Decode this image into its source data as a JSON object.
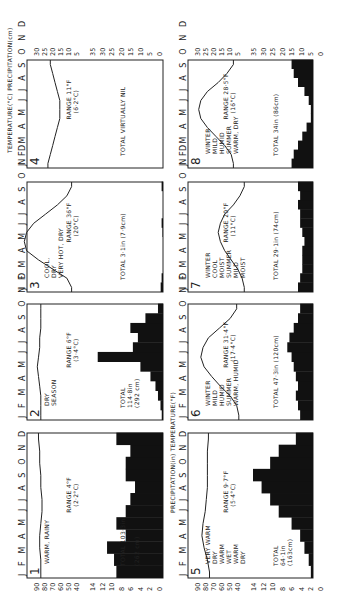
{
  "figure": {
    "orientation": "rotated-90-ccw",
    "left_axis_labels": {
      "top_row": "PRECIPITATION(in) TEMPERATURE(°F)",
      "bottom_row_temp": "°F",
      "bottom_row_precip": "in."
    },
    "right_axis_labels": {
      "top_row": "TEMPERATURE(°C) PRECIPITATION(cm)",
      "bottom_row_temp": "°C",
      "bottom_row_precip": "cm"
    },
    "months": "J F M A M J J A S O N D",
    "temp_f_ticks": [
      "90",
      "80",
      "70",
      "60",
      "50",
      "40"
    ],
    "precip_in_ticks": [
      "14",
      "12",
      "10",
      "8",
      "6",
      "4",
      "2",
      "0"
    ],
    "temp_c_ticks": [
      "30",
      "25",
      "20",
      "15",
      "10",
      "5"
    ],
    "precip_cm_ticks": [
      "35",
      "30",
      "25",
      "20",
      "15",
      "10",
      "5",
      "0"
    ]
  },
  "chart_data": [
    {
      "type": "bar+line",
      "panel": "1",
      "labels": [
        "WARM, RAINY"
      ],
      "range": "RANGE 4°F",
      "range_c": "(2·2°C)",
      "total": "TOTAL 103·3in",
      "total_cm": "(262 cm)",
      "icon": "tree",
      "temp_f": [
        80,
        80,
        81,
        81,
        80,
        79,
        79,
        80,
        80,
        81,
        81,
        82
      ],
      "precip_in": [
        10,
        10.5,
        12,
        8,
        10,
        8,
        7,
        6,
        8,
        8,
        7,
        10
      ]
    },
    {
      "type": "bar+line",
      "panel": "2",
      "labels": [
        "DRY",
        "SEASON"
      ],
      "range": "RANGE 6°F",
      "range_c": "(3·4°C)",
      "total": "TOTAL",
      "total_in": "114·8in",
      "total_cm": "(292 cm)",
      "icon": "H / tree",
      "temp_f": [
        80,
        80,
        80,
        81,
        82,
        83,
        82,
        81,
        81,
        80,
        80,
        80
      ],
      "precip_in": [
        0.5,
        1,
        2,
        3,
        5,
        9,
        26,
        12,
        10,
        13,
        7,
        2
      ]
    },
    {
      "type": "bar+line",
      "panel": "3",
      "labels": [
        "COOL,",
        "DRY",
        "VERY HOT, DRY"
      ],
      "range": "RANGE 36°F",
      "range_c": "(20°C)",
      "total": "TOTAL 3·1in (7·9cm)",
      "icon": "H",
      "temp_c": [
        12,
        14,
        20,
        26,
        31,
        32,
        31,
        28,
        23,
        18,
        14,
        12
      ],
      "precip_in": [
        0.5,
        0.3,
        0,
        0,
        0,
        0,
        0.1,
        0.3,
        0,
        0,
        0,
        0.3
      ]
    },
    {
      "type": "bar+line",
      "panel": "4",
      "labels": [],
      "range": "RANGE 11°F",
      "range_c": "(6·2°C)",
      "total": "TOTAL VIRTUALLY NIL",
      "icon": "H",
      "temp_c": [
        22,
        21,
        20,
        19,
        18,
        17,
        17,
        17,
        18,
        19,
        20,
        21
      ],
      "precip_in": [
        0,
        0,
        0,
        0,
        0,
        0,
        0,
        0,
        0,
        0,
        0,
        0
      ]
    },
    {
      "type": "bar+line",
      "panel": "5",
      "labels": [
        "VERY WARM",
        "DRY",
        "WARM",
        "WET",
        "WARM",
        "DRY"
      ],
      "range": "RANGE 9·7°F",
      "range_c": "(5·4°C)",
      "total": "TOTAL",
      "total_in": "64·1in",
      "total_cm": "(163cm)",
      "icon": "H / tree",
      "temp_f": [
        72,
        74,
        77,
        79,
        78,
        76,
        75,
        74,
        74,
        74,
        74,
        73
      ],
      "precip_in": [
        0.5,
        1,
        2,
        3,
        5,
        8,
        10,
        12,
        14,
        10,
        8,
        4
      ]
    },
    {
      "type": "bar+line",
      "panel": "6",
      "labels": [
        "WINTER",
        "MILD",
        "HUMID",
        "SUMMER",
        "WARM, HUMID"
      ],
      "range": "RANGE 31·4°F",
      "range_c": "(17·4°C)",
      "total": "TOTAL 47·3in (120cm)",
      "icon": "cyclone / H",
      "temp_f": [
        45,
        47,
        53,
        62,
        70,
        77,
        80,
        78,
        73,
        63,
        53,
        47
      ],
      "precip_in": [
        3,
        3.5,
        4,
        3.5,
        4,
        4.5,
        5,
        6,
        5.5,
        4.5,
        3.5,
        3
      ]
    },
    {
      "type": "bar+line",
      "panel": "7",
      "labels": [
        "WINTER",
        "COOL",
        "MOIST",
        "SUMMER",
        "MILD",
        "MOIST"
      ],
      "range": "RANGE 20°F",
      "range_c": "(11°C)",
      "total": "TOTAL 29·1in (74cm)",
      "icon": "cyclone",
      "temp_c": [
        5,
        6,
        8,
        11,
        14,
        16,
        17,
        16,
        14,
        10,
        7,
        5
      ],
      "precip_in": [
        3.5,
        3,
        2.5,
        2.5,
        2.5,
        2,
        2.5,
        3,
        3,
        3.5,
        3,
        3.5
      ]
    },
    {
      "type": "bar+line",
      "panel": "8",
      "labels": [
        "WINTER",
        "MILD",
        "HUMID",
        "SUMMER",
        "WARM, DRY"
      ],
      "range": "RANGE 28·5°F",
      "range_c": "(16°C)",
      "total": "TOTAL 34in (86cm)",
      "icon": "cyclone / H",
      "temp_c": [
        10,
        11,
        14,
        18,
        22,
        25,
        26,
        25,
        22,
        17,
        13,
        10
      ],
      "precip_in": [
        5,
        4.5,
        3.5,
        2.5,
        1.5,
        0.5,
        0.5,
        1,
        2,
        3.5,
        4.5,
        5
      ]
    }
  ]
}
